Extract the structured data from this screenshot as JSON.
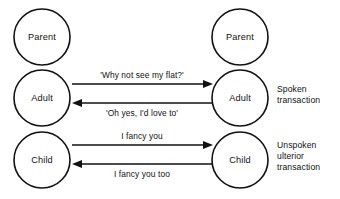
{
  "diagram": {
    "type": "transactional-analysis-ego-state",
    "background_color": "#ffffff",
    "stroke_color": "#111111",
    "columns": {
      "left": {
        "label": "Person A",
        "center_x": 42
      },
      "right": {
        "label": "Person B",
        "center_x": 240
      }
    },
    "ego_states": {
      "left": [
        {
          "key": "parent",
          "label": "Parent",
          "cx": 42,
          "cy": 37,
          "r": 28
        },
        {
          "key": "adult",
          "label": "Adult",
          "cx": 42,
          "cy": 98,
          "r": 28
        },
        {
          "key": "child",
          "label": "Child",
          "cx": 42,
          "cy": 160,
          "r": 28
        }
      ],
      "right": [
        {
          "key": "parent",
          "label": "Parent",
          "cx": 240,
          "cy": 37,
          "r": 28
        },
        {
          "key": "adult",
          "label": "Adult",
          "cx": 240,
          "cy": 98,
          "r": 28
        },
        {
          "key": "child",
          "label": "Child",
          "cx": 240,
          "cy": 160,
          "r": 28
        }
      ]
    },
    "transactions": [
      {
        "key": "adult-outgoing",
        "label": "'Why not see my flat?'",
        "direction": "right",
        "from": "left-adult",
        "to": "right-adult",
        "y": 84,
        "x_start": 72,
        "x_end": 213,
        "label_x": 142,
        "label_y": 78
      },
      {
        "key": "adult-incoming",
        "label": "'Oh yes, I'd love to'",
        "direction": "left",
        "from": "right-adult",
        "to": "left-adult",
        "y": 103,
        "x_start": 213,
        "x_end": 72,
        "label_x": 142,
        "label_y": 116
      },
      {
        "key": "child-outgoing",
        "label": "I fancy you",
        "direction": "right",
        "from": "left-child",
        "to": "right-child",
        "y": 145,
        "x_start": 72,
        "x_end": 213,
        "label_x": 142,
        "label_y": 139
      },
      {
        "key": "child-incoming",
        "label": "I fancy you too",
        "direction": "left",
        "from": "right-child",
        "to": "left-child",
        "y": 164,
        "x_start": 213,
        "x_end": 72,
        "label_x": 142,
        "label_y": 177
      }
    ],
    "annotations": [
      {
        "key": "spoken",
        "lines": [
          "Spoken",
          "transaction"
        ],
        "x": 277,
        "y": 92
      },
      {
        "key": "unspoken",
        "lines": [
          "Unspoken",
          "ulterior",
          "transaction"
        ],
        "x": 277,
        "y": 148
      }
    ]
  }
}
